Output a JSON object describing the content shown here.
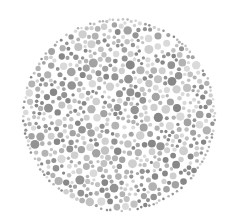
{
  "image": {
    "description": "Ishihara-style color vision test plate rendered in greyscale: a circular field of dots of varying sizes and grey tones",
    "background": "#ffffff"
  },
  "plate": {
    "center_x": 119,
    "center_y": 115,
    "radius": 96,
    "dot_count": 900,
    "dot_radius_min": 1.6,
    "dot_radius_max": 4.6,
    "seed": 7,
    "palette": [
      "#878787",
      "#939393",
      "#a3a3a3",
      "#b3b3b3",
      "#c2c2c2",
      "#cfcfcf",
      "#dadada"
    ]
  }
}
